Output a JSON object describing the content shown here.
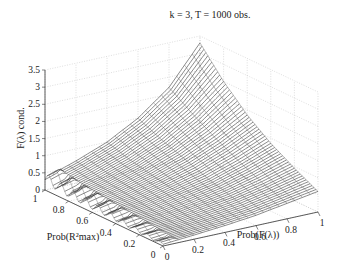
{
  "chart_data": {
    "type": "surface",
    "title": "k = 3, T = 1000 obs.",
    "xlabel": "Prob(F(λ))",
    "ylabel": "Prob(R²max)",
    "zlabel": "F(λ) cond.",
    "xlim": [
      0,
      1
    ],
    "ylim": [
      0,
      1
    ],
    "zlim": [
      0,
      3.5
    ],
    "x_ticks": [
      "0",
      "0.2",
      "0.4",
      "0.6",
      "0.8",
      "1"
    ],
    "y_ticks": [
      "0",
      "0.2",
      "0.4",
      "0.6",
      "0.8",
      "1"
    ],
    "z_ticks": [
      "0",
      "0.5",
      "1",
      "1.5",
      "2",
      "2.5",
      "3",
      "3.5"
    ],
    "grid": true,
    "rendering": "mesh wireframe (black lines)",
    "surface_samples": {
      "x": [
        0,
        0.2,
        0.4,
        0.6,
        0.8,
        1.0
      ],
      "y": [
        0,
        0.2,
        0.4,
        0.6,
        0.8,
        1.0
      ],
      "z": [
        [
          0.05,
          0.12,
          0.2,
          0.3,
          0.45,
          0.6
        ],
        [
          0.1,
          0.2,
          0.35,
          0.5,
          0.7,
          0.95
        ],
        [
          0.15,
          0.3,
          0.5,
          0.7,
          1.0,
          1.35
        ],
        [
          0.2,
          0.4,
          0.65,
          0.95,
          1.35,
          1.85
        ],
        [
          0.25,
          0.5,
          0.8,
          1.2,
          1.75,
          2.5
        ],
        [
          0.35,
          0.65,
          1.0,
          1.5,
          2.2,
          3.3
        ]
      ]
    }
  }
}
